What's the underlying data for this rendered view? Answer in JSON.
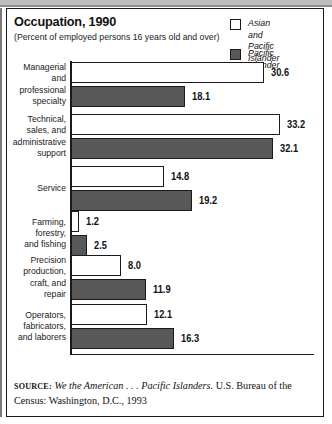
{
  "header": {
    "title": "Occupation, 1990",
    "subtitle": "(Percent of employed persons 16 years old and over)"
  },
  "legend": {
    "items": [
      {
        "label": "Asian and\nPacific Islander",
        "swatch": "hollow-square-icon",
        "color": "#ffffff"
      },
      {
        "label": "Pacific Islander",
        "swatch": "filled-square-icon",
        "color": "#585858"
      }
    ]
  },
  "source": {
    "kicker": "SOURCE:",
    "italic_title": "We the American . . . Pacific Islanders.",
    "rest": " U.S. Bureau of the Census: Washington, D.C., 1993"
  },
  "chart_data": {
    "type": "bar",
    "orientation": "horizontal",
    "title": "Occupation, 1990",
    "subtitle": "(Percent of employed persons 16 years old and over)",
    "xlabel": "",
    "ylabel": "",
    "xlim": [
      0,
      33.2
    ],
    "grid": false,
    "legend_position": "top-right",
    "categories": [
      "Managerial\nand\nprofessional\nspecialty",
      "Technical,\nsales, and\nadministrative\nsupport",
      "Service",
      "Farming,\nforestry,\nand fishing",
      "Precision\nproduction,\ncraft, and\nrepair",
      "Operators,\nfabricators,\nand laborers"
    ],
    "series": [
      {
        "name": "Asian and Pacific Islander",
        "color": "#ffffff",
        "values": [
          30.6,
          33.2,
          14.8,
          1.2,
          8.0,
          12.1
        ],
        "labels": [
          "30.6",
          "33.2",
          "14.8",
          "1.2",
          "8.0",
          "12.1"
        ]
      },
      {
        "name": "Pacific Islander",
        "color": "#585858",
        "values": [
          18.1,
          32.1,
          19.2,
          2.5,
          11.9,
          16.3
        ],
        "labels": [
          "18.1",
          "32.1",
          "19.2",
          "2.5",
          "11.9",
          "16.3"
        ]
      }
    ]
  }
}
